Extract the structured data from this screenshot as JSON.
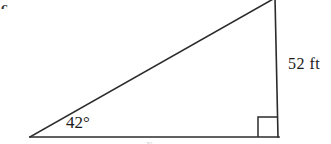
{
  "figure": {
    "item_letter": "c.",
    "angle_label": "42°",
    "side_label": "52 ft",
    "bottom_label": "x",
    "stroke_color": "#2b2b2b",
    "background_color": "#ffffff",
    "stroke_width": "1.6"
  },
  "geometry": {
    "type": "right-triangle",
    "left_vertex": {
      "x": 30,
      "y": 137
    },
    "right_vertex": {
      "x": 278,
      "y": 137
    },
    "apex_vertex": {
      "x": 275,
      "y": 0
    },
    "right_angle_marker": {
      "x": 258,
      "y": 117,
      "size": 20
    },
    "known_angle_degrees": 42,
    "known_side_length": 52,
    "known_side_units": "ft",
    "known_side_position": "opposite-vertical-leg"
  }
}
